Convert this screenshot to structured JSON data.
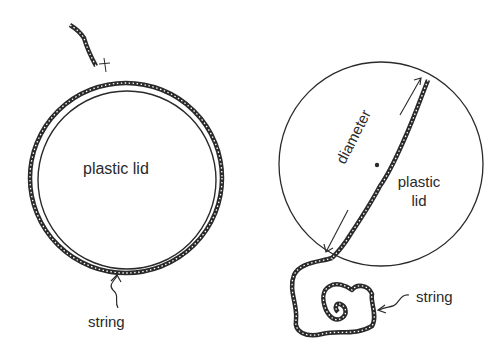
{
  "figure": {
    "left_panel": {
      "lid_label": "plastic lid",
      "string_label": "string"
    },
    "right_panel": {
      "diameter_label": "diameter",
      "lid_label_line1": "plastic",
      "lid_label_line2": "lid",
      "string_label": "string"
    }
  },
  "colors": {
    "ink": "#2a2a2a",
    "background": "#ffffff"
  }
}
